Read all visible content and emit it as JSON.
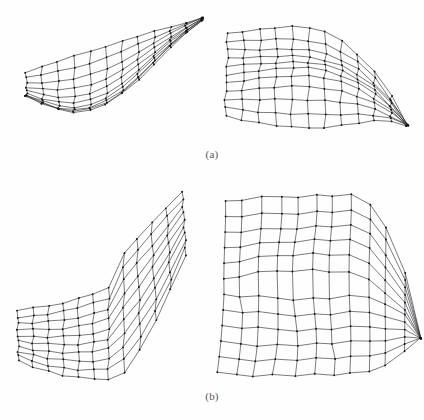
{
  "figure": {
    "background_color": "#fefefe",
    "line_color": "#2b2b30",
    "vertex_color": "#17171b",
    "caption_color": "#58575a"
  },
  "panels": [
    {
      "id": "a",
      "caption": "(a)",
      "meshes": [
        {
          "name": "mesh-a-left",
          "label": "saddle-cusp surface, left view",
          "box": {
            "x": 18,
            "y": 8,
            "w": 192,
            "h": 138
          },
          "grid": {
            "u": 11,
            "v": 9
          },
          "surface": "cusp-saddle",
          "show_vertices": true,
          "params": {
            "cusp_x": 0.96,
            "cusp_y": 0.035,
            "fan_strength": 1.0,
            "bowl_depth": 0.52,
            "rim_lift": 0.3,
            "twist": 0.22,
            "left_open": 0.17
          }
        },
        {
          "name": "mesh-a-right",
          "label": "bulged quad patch, right view",
          "box": {
            "x": 218,
            "y": 10,
            "w": 192,
            "h": 136
          },
          "grid": {
            "u": 11,
            "v": 10
          },
          "surface": "bulge-corner-pinch",
          "show_vertices": true,
          "params": {
            "pinch_x": 0.985,
            "pinch_y": 0.7,
            "dome": 0.3,
            "ripple": 0.085,
            "skirt": 0.16,
            "left_wave": 0.13
          }
        }
      ]
    },
    {
      "id": "b",
      "caption": "(b)",
      "meshes": [
        {
          "name": "mesh-b-left",
          "label": "folded surface with vertical horn, left view",
          "box": {
            "x": 12,
            "y": 8,
            "w": 200,
            "h": 210
          },
          "grid": {
            "u": 11,
            "v": 9
          },
          "surface": "horn-fold",
          "show_vertices": true,
          "params": {
            "horn_x": 0.8,
            "horn_y": 0.06,
            "horn_width": 0.13,
            "waist_y": 0.36,
            "apron_depth": 0.58,
            "tail_sweep": 0.3,
            "left_taper": 0.2
          }
        },
        {
          "name": "mesh-b-right",
          "label": "creased block surface with right spike, right view",
          "box": {
            "x": 214,
            "y": 4,
            "w": 204,
            "h": 214
          },
          "grid": {
            "u": 11,
            "v": 11
          },
          "surface": "block-crease",
          "show_vertices": true,
          "params": {
            "spike_x": 1.02,
            "spike_y": 0.64,
            "crease_y": 0.46,
            "shoulder": 0.18,
            "jag": 0.09,
            "lower_spread": 0.22
          }
        }
      ]
    }
  ]
}
